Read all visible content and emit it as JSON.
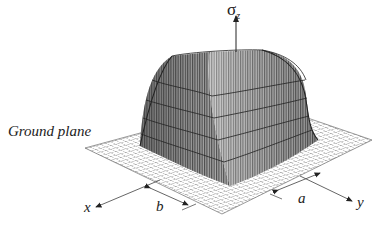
{
  "figure": {
    "labels": {
      "vertical_axis": "σ",
      "vertical_axis_sub": "z",
      "ground_plane": "Ground plane",
      "x_axis": "x",
      "y_axis": "y",
      "dim_b": "b",
      "dim_a": "a"
    },
    "colors": {
      "line": "#222222",
      "surface_dark": "#5a5a5a",
      "surface_light": "#d8d8d8",
      "grid": "#555555"
    }
  }
}
